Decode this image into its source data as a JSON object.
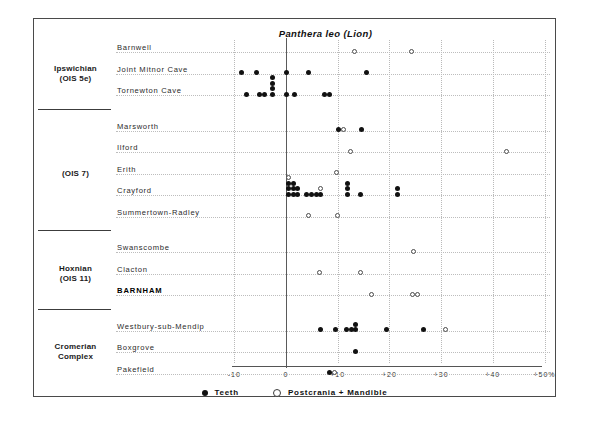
{
  "chart_data": {
    "type": "scatter",
    "title": "Panthera leo (Lion)",
    "xlabel": "",
    "ylabel": "",
    "xlim": [
      -12,
      52
    ],
    "xticks": [
      "-10",
      "0",
      "+10",
      "+20",
      "+30",
      "+40",
      "+50%"
    ],
    "xtick_values": [
      -10,
      0,
      10,
      20,
      30,
      40,
      50
    ],
    "grid": "vertical dotted gridlines at each 10% tick; solid reference line at 0",
    "legend_position": "bottom-center",
    "legend": [
      {
        "key": "teeth",
        "label": "Teeth",
        "marker": "filled-circle",
        "color": "#111111"
      },
      {
        "key": "post",
        "label": "Postcrania + Mandible",
        "marker": "open-circle",
        "color": "#ffffff"
      }
    ],
    "groups": [
      {
        "name": "Ipswichian\n(OIS 5e)",
        "lines": [
          "Ipswichian",
          "(OIS 5e)"
        ],
        "sites": [
          {
            "label": "Barnwell",
            "bold": false,
            "teeth": [],
            "post": [
              13.3,
              24.3
            ]
          },
          {
            "label": "Joint Mitnor Cave",
            "bold": false,
            "teeth": [
              -8.6,
              -5.7,
              0.1,
              4.3,
              15.6
            ],
            "post": []
          },
          {
            "label": "Tornewton Cave",
            "bold": false,
            "teeth": [
              -7.6,
              -5.2,
              -4.1,
              -2.6,
              -2.6,
              -2.6,
              -2.6,
              0.1,
              1.7,
              7.4,
              8.4
            ],
            "post": []
          }
        ]
      },
      {
        "name": "(OIS 7)",
        "lines": [
          "(OIS 7)"
        ],
        "sites": [
          {
            "label": "Marsworth",
            "bold": false,
            "teeth": [
              10.1,
              14.6
            ],
            "post": [
              11.2
            ]
          },
          {
            "label": "Ilford",
            "bold": false,
            "teeth": [],
            "post": [
              12.4,
              42.6
            ]
          },
          {
            "label": "Erith",
            "bold": false,
            "teeth": [],
            "post": [
              9.7
            ]
          },
          {
            "label": "Crayford",
            "bold": false,
            "teeth": [
              0.4,
              0.4,
              0.4,
              1.4,
              1.4,
              1.4,
              2.2,
              2.2,
              3.9,
              4.9,
              5.9,
              6.6,
              11.9,
              11.9,
              11.9,
              14.4,
              21.5,
              21.5
            ],
            "post": [
              0.4,
              6.6
            ]
          },
          {
            "label": "Summertown-Radley",
            "bold": false,
            "teeth": [],
            "post": [
              4.3,
              9.9
            ]
          }
        ]
      },
      {
        "name": "Hoxnian\n(OIS 11)",
        "lines": [
          "Hoxnian",
          "(OIS 11)"
        ],
        "sites": [
          {
            "label": "Swanscombe",
            "bold": false,
            "teeth": [],
            "post": [
              24.6
            ]
          },
          {
            "label": "Clacton",
            "bold": false,
            "teeth": [],
            "post": [
              6.4,
              14.4
            ]
          },
          {
            "label": "BARNHAM",
            "bold": true,
            "teeth": [],
            "post": [
              16.6,
              24.4,
              25.5
            ]
          }
        ]
      },
      {
        "name": "Cromerian\nComplex",
        "lines": [
          "Cromerian",
          "Complex"
        ],
        "sites": [
          {
            "label": "Westbury-sub-Mendip",
            "bold": false,
            "teeth": [
              6.6,
              9.5,
              11.7,
              12.7,
              13.5,
              13.5,
              19.5,
              26.5
            ],
            "post": [
              30.8
            ]
          },
          {
            "label": "Boxgrove",
            "bold": false,
            "teeth": [
              13.5
            ],
            "post": []
          },
          {
            "label": "Pakefield",
            "bold": false,
            "teeth": [
              8.4
            ],
            "post": [
              9.3
            ]
          }
        ]
      }
    ]
  }
}
